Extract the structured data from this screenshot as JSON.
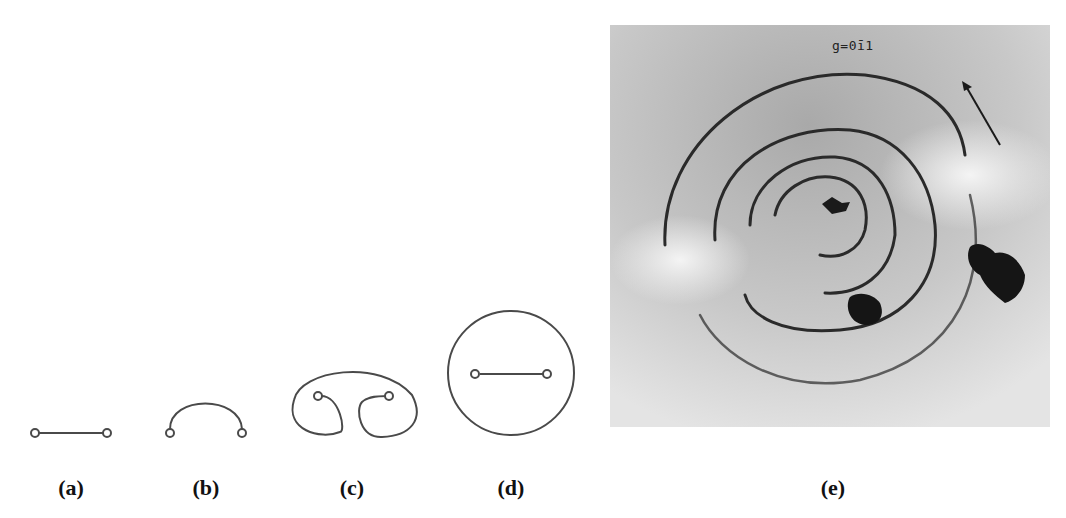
{
  "figure": {
    "panels": [
      {
        "id": "a",
        "label": "(a)",
        "description": "Straight dislocation segment pinned at two ends"
      },
      {
        "id": "b",
        "label": "(b)",
        "description": "Segment bowing out into a semicircular arc"
      },
      {
        "id": "c",
        "label": "(c)",
        "description": "Loop wrapping around the pinning points"
      },
      {
        "id": "d",
        "label": "(d)",
        "description": "Closed loop released, original segment regenerated"
      },
      {
        "id": "e",
        "label": "(e)",
        "description": "TEM micrograph of concentric dislocation loops with arrow",
        "annotation": "g=01̄1",
        "annotation_display": "g=0ī1"
      }
    ],
    "colors": {
      "line": "#4a4a4a",
      "background": "#ffffff",
      "micrograph_bg": "#c9c9c9",
      "dark_feature": "#1a1a1a"
    }
  }
}
